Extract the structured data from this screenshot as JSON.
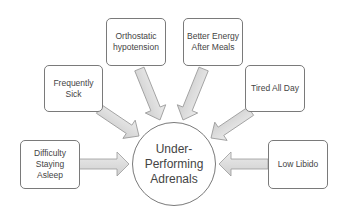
{
  "diagram": {
    "type": "radial-convergence",
    "center": {
      "label": "Under-Performing Adrenals"
    },
    "nodes": [
      {
        "id": "difficulty",
        "label": "Difficulty Staying Asleep"
      },
      {
        "id": "sick",
        "label": "Frequently Sick"
      },
      {
        "id": "orthostatic",
        "label": "Orthostatic hypotension"
      },
      {
        "id": "energy",
        "label": "Better Energy After Meals"
      },
      {
        "id": "tired",
        "label": "Tired All Day"
      },
      {
        "id": "libido",
        "label": "Low Libido"
      }
    ],
    "colors": {
      "arrow_fill": "#d4d4d4",
      "arrow_stroke": "#9a9a9a",
      "border": "#7a7a7a",
      "text": "#444444"
    }
  }
}
